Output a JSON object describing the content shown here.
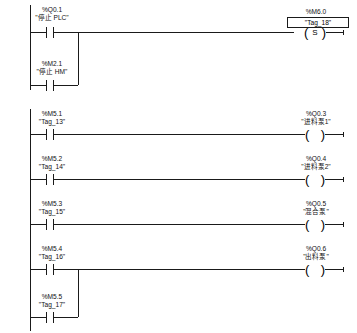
{
  "diagram": {
    "kind": "ladder-logic",
    "language": "LAD",
    "background_color": "#ffffff",
    "line_color": "#1a1a1a"
  },
  "networks": [
    {
      "id": "network-1",
      "rungs": [
        {
          "id": "rung-1",
          "contacts": [
            {
              "address": "%Q0.1",
              "name": "\"停止 PLC\"",
              "type": "no-contact"
            }
          ],
          "coil": {
            "address": "%M6.0",
            "name": "\"Tag_18\"",
            "type": "set-coil",
            "letter": "S",
            "selected": true,
            "paren_left": "(",
            "paren_right": ")"
          }
        },
        {
          "id": "rung-1-branch",
          "contacts": [
            {
              "address": "%M2.1",
              "name": "\"停止 HM\"",
              "type": "no-contact"
            }
          ],
          "coil": null
        }
      ]
    },
    {
      "id": "network-2",
      "rungs": [
        {
          "id": "rung-2",
          "contacts": [
            {
              "address": "%M5.1",
              "name": "\"Tag_13\"",
              "type": "no-contact"
            }
          ],
          "coil": {
            "address": "%Q0.3",
            "name": "\"进料泵1\"",
            "type": "output-coil",
            "letter": "",
            "selected": false,
            "paren_left": "(",
            "paren_right": ")"
          }
        },
        {
          "id": "rung-3",
          "contacts": [
            {
              "address": "%M5.2",
              "name": "\"Tag_14\"",
              "type": "no-contact"
            }
          ],
          "coil": {
            "address": "%Q0.4",
            "name": "\"进料泵2\"",
            "type": "output-coil",
            "letter": "",
            "selected": false,
            "paren_left": "(",
            "paren_right": ")"
          }
        },
        {
          "id": "rung-4",
          "contacts": [
            {
              "address": "%M5.3",
              "name": "\"Tag_15\"",
              "type": "no-contact"
            }
          ],
          "coil": {
            "address": "%Q0.5",
            "name": "\"混合泵\"",
            "type": "output-coil",
            "letter": "",
            "selected": false,
            "paren_left": "(",
            "paren_right": ")"
          }
        },
        {
          "id": "rung-5",
          "contacts": [
            {
              "address": "%M5.4",
              "name": "\"Tag_16\"",
              "type": "no-contact"
            }
          ],
          "coil": {
            "address": "%Q0.6",
            "name": "\"出料泵\"",
            "type": "output-coil",
            "letter": "",
            "selected": false,
            "paren_left": "(",
            "paren_right": ")"
          }
        },
        {
          "id": "rung-5-branch",
          "contacts": [
            {
              "address": "%M5.5",
              "name": "\"Tag_17\"",
              "type": "no-contact"
            }
          ],
          "coil": null
        }
      ]
    }
  ]
}
